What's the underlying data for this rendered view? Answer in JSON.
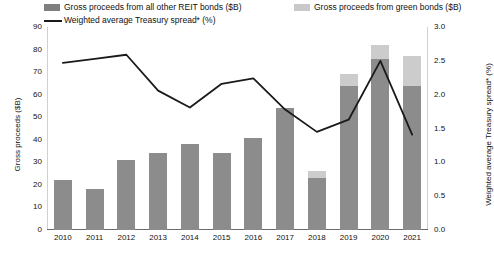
{
  "legend": {
    "items": [
      {
        "label": "Gross proceeds from all other REIT bonds ($B)",
        "swatch": "dark-square-swatch",
        "color": "#7f7f7f"
      },
      {
        "label": "Gross proceeds from green bonds ($B)",
        "swatch": "light-square-swatch",
        "color": "#c9c9c9"
      },
      {
        "label": "Weighted average Treasury spread* (%)",
        "swatch": "line-swatch",
        "color": "#1a1a1a"
      }
    ]
  },
  "axes": {
    "left": {
      "title": "Gross proceeds ($B)",
      "ticks": [
        "0",
        "10",
        "20",
        "30",
        "40",
        "50",
        "60",
        "70",
        "80",
        "90"
      ],
      "min": 0,
      "max": 90
    },
    "right": {
      "title": "Weighted average Treasury spread* (%)",
      "ticks": [
        "0.0",
        "0.5",
        "1.0",
        "1.5",
        "2.0",
        "2.5",
        "3.0"
      ],
      "min": 0,
      "max": 3.0
    }
  },
  "chart_data": {
    "type": "bar",
    "title": "",
    "subtitle": "",
    "xlabel": "",
    "ylabel": "Gross proceeds ($B)",
    "y2label": "Weighted average Treasury spread* (%)",
    "ylim": [
      0,
      90
    ],
    "y2lim": [
      0,
      3.0
    ],
    "grid": false,
    "legend_position": "top",
    "categories": [
      "2010",
      "2011",
      "2012",
      "2013",
      "2014",
      "2015",
      "2016",
      "2017",
      "2018",
      "2019",
      "2020",
      "2021"
    ],
    "series": [
      {
        "name": "Gross proceeds from all other REIT bonds ($B)",
        "type": "bar",
        "stack": "proceeds",
        "axis": "left",
        "color": "#8c8c8c",
        "values": [
          22,
          18,
          31,
          34,
          38,
          34,
          41,
          54,
          23,
          64,
          76,
          64
        ]
      },
      {
        "name": "Gross proceeds from green bonds ($B)",
        "type": "bar",
        "stack": "proceeds",
        "axis": "left",
        "color": "#cccccc",
        "values": [
          0,
          0,
          0,
          0,
          0,
          0,
          0,
          0,
          3,
          5,
          6,
          13
        ]
      },
      {
        "name": "Weighted average Treasury spread* (%)",
        "type": "line",
        "axis": "right",
        "color": "#1a1a1a",
        "values": [
          2.47,
          2.53,
          2.59,
          2.06,
          1.81,
          2.16,
          2.24,
          1.78,
          1.45,
          1.63,
          2.5,
          1.41
        ]
      }
    ],
    "totals": [
      22,
      18,
      31,
      34,
      38,
      34,
      41,
      54,
      26,
      69,
      82,
      77
    ]
  }
}
